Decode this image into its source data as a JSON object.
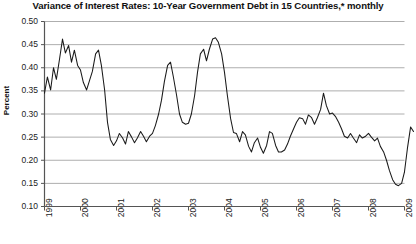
{
  "chart_data": {
    "type": "line",
    "title": "Variance of Interest Rates: 10-Year Government Debt in 15 Countries,* monthly",
    "xlabel": "",
    "ylabel": "Percent",
    "ylim": [
      0.1,
      0.5
    ],
    "xlim": [
      1999.0,
      2009.0
    ],
    "yticks": [
      0.5,
      0.45,
      0.4,
      0.35,
      0.3,
      0.25,
      0.2,
      0.15,
      0.1
    ],
    "ytick_labels": [
      "0.50",
      "0.45",
      "0.40",
      "0.35",
      "0.30",
      "0.25",
      "0.20",
      "0.15",
      "0.10"
    ],
    "xticks": [
      1999,
      2000,
      2001,
      2002,
      2003,
      2004,
      2005,
      2006,
      2007,
      2008,
      2009
    ],
    "xtick_labels": [
      "1999",
      "2000",
      "2001",
      "2002",
      "2003",
      "2004",
      "2005",
      "2006",
      "2007",
      "2008",
      "2009"
    ],
    "grid": "horizontal",
    "legend": "none",
    "line_color": "#1a1a1a",
    "grid_color": "#aeaeae",
    "axis_color": "#555555",
    "series": [
      {
        "name": "Variance of interest rates",
        "x": [
          1999.0,
          1999.08,
          1999.17,
          1999.25,
          1999.33,
          1999.42,
          1999.5,
          1999.58,
          1999.67,
          1999.75,
          1999.83,
          1999.92,
          2000.0,
          2000.08,
          2000.17,
          2000.25,
          2000.33,
          2000.42,
          2000.5,
          2000.58,
          2000.67,
          2000.75,
          2000.83,
          2000.92,
          2001.0,
          2001.08,
          2001.17,
          2001.25,
          2001.33,
          2001.42,
          2001.5,
          2001.58,
          2001.67,
          2001.75,
          2001.83,
          2001.92,
          2002.0,
          2002.08,
          2002.17,
          2002.25,
          2002.33,
          2002.42,
          2002.5,
          2002.58,
          2002.67,
          2002.75,
          2002.83,
          2002.92,
          2003.0,
          2003.08,
          2003.17,
          2003.25,
          2003.33,
          2003.42,
          2003.5,
          2003.58,
          2003.67,
          2003.75,
          2003.83,
          2003.92,
          2004.0,
          2004.08,
          2004.17,
          2004.25,
          2004.33,
          2004.42,
          2004.5,
          2004.58,
          2004.67,
          2004.75,
          2004.83,
          2004.92,
          2005.0,
          2005.08,
          2005.17,
          2005.25,
          2005.33,
          2005.42,
          2005.5,
          2005.58,
          2005.67,
          2005.75,
          2005.83,
          2005.92,
          2006.0,
          2006.08,
          2006.17,
          2006.25,
          2006.33,
          2006.42,
          2006.5,
          2006.58,
          2006.67,
          2006.75,
          2006.83,
          2006.92,
          2007.0,
          2007.08,
          2007.17,
          2007.25,
          2007.33,
          2007.42,
          2007.5,
          2007.58,
          2007.67,
          2007.75,
          2007.83,
          2007.92,
          2008.0,
          2008.08,
          2008.17,
          2008.25,
          2008.33,
          2008.42,
          2008.5,
          2008.58,
          2008.67,
          2008.75,
          2008.83,
          2008.92,
          2009.0
        ],
        "values": [
          0.345,
          0.38,
          0.352,
          0.4,
          0.375,
          0.42,
          0.462,
          0.432,
          0.448,
          0.412,
          0.438,
          0.405,
          0.395,
          0.368,
          0.352,
          0.372,
          0.392,
          0.43,
          0.438,
          0.405,
          0.352,
          0.282,
          0.245,
          0.232,
          0.242,
          0.258,
          0.248,
          0.235,
          0.262,
          0.25,
          0.238,
          0.248,
          0.262,
          0.252,
          0.24,
          0.252,
          0.258,
          0.275,
          0.3,
          0.33,
          0.37,
          0.405,
          0.412,
          0.38,
          0.34,
          0.3,
          0.282,
          0.278,
          0.28,
          0.3,
          0.34,
          0.39,
          0.43,
          0.44,
          0.415,
          0.44,
          0.462,
          0.465,
          0.455,
          0.43,
          0.39,
          0.34,
          0.29,
          0.26,
          0.258,
          0.24,
          0.262,
          0.255,
          0.23,
          0.218,
          0.238,
          0.248,
          0.228,
          0.215,
          0.232,
          0.262,
          0.258,
          0.232,
          0.218,
          0.218,
          0.222,
          0.235,
          0.252,
          0.268,
          0.282,
          0.292,
          0.29,
          0.278,
          0.298,
          0.292,
          0.278,
          0.292,
          0.31,
          0.345,
          0.318,
          0.3,
          0.302,
          0.295,
          0.282,
          0.268,
          0.252,
          0.248,
          0.258,
          0.248,
          0.238,
          0.255,
          0.248,
          0.252,
          0.258,
          0.25,
          0.242,
          0.248,
          0.23,
          0.218,
          0.2,
          0.178,
          0.158,
          0.148,
          0.145,
          0.15,
          0.175
        ]
      },
      {
        "name": "tail segment",
        "x": [
          2009.0,
          2009.08,
          2009.17,
          2009.25
        ],
        "values": [
          0.175,
          0.225,
          0.272,
          0.262
        ]
      }
    ]
  }
}
